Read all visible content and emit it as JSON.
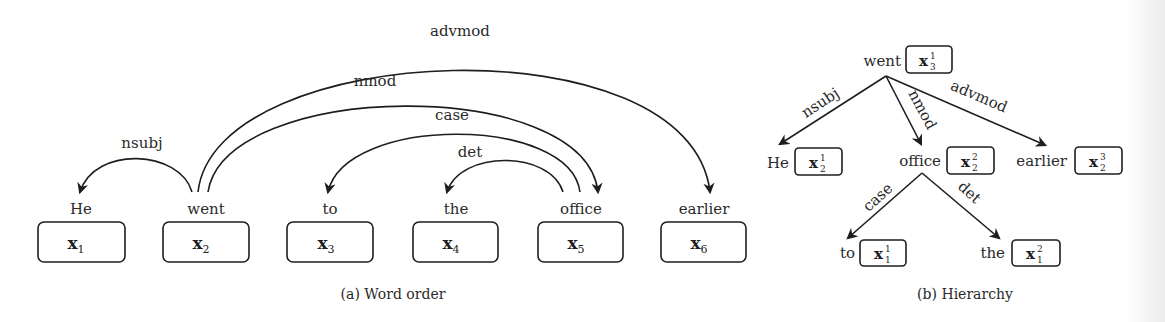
{
  "panel_a": {
    "caption": "(a) Word order",
    "tokens": [
      {
        "word": "He",
        "var": "x",
        "sub": "1"
      },
      {
        "word": "went",
        "var": "x",
        "sub": "2"
      },
      {
        "word": "to",
        "var": "x",
        "sub": "3"
      },
      {
        "word": "the",
        "var": "x",
        "sub": "4"
      },
      {
        "word": "office",
        "var": "x",
        "sub": "5"
      },
      {
        "word": "earlier",
        "var": "x",
        "sub": "6"
      }
    ],
    "arcs": [
      {
        "label": "nsubj",
        "head": "went",
        "dependent": "He"
      },
      {
        "label": "advmod",
        "head": "went",
        "dependent": "earlier"
      },
      {
        "label": "nmod",
        "head": "went",
        "dependent": "office"
      },
      {
        "label": "case",
        "head": "office",
        "dependent": "to"
      },
      {
        "label": "det",
        "head": "office",
        "dependent": "the"
      }
    ]
  },
  "panel_b": {
    "caption": "(b) Hierarchy",
    "nodes": [
      {
        "word": "went",
        "var": "x",
        "sup": "1",
        "sub": "3"
      },
      {
        "word": "He",
        "var": "x",
        "sup": "1",
        "sub": "2"
      },
      {
        "word": "office",
        "var": "x",
        "sup": "2",
        "sub": "2"
      },
      {
        "word": "earlier",
        "var": "x",
        "sup": "3",
        "sub": "2"
      },
      {
        "word": "to",
        "var": "x",
        "sup": "1",
        "sub": "1"
      },
      {
        "word": "the",
        "var": "x",
        "sup": "2",
        "sub": "1"
      }
    ],
    "edges": [
      {
        "label": "nsubj",
        "from": "went",
        "to": "He"
      },
      {
        "label": "nmod",
        "from": "went",
        "to": "office"
      },
      {
        "label": "advmod",
        "from": "went",
        "to": "earlier"
      },
      {
        "label": "case",
        "from": "office",
        "to": "to"
      },
      {
        "label": "det",
        "from": "office",
        "to": "the"
      }
    ]
  }
}
